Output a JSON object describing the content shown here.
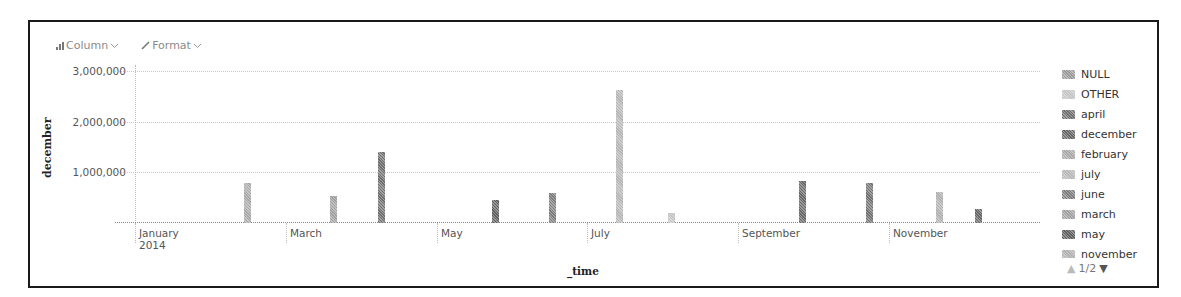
{
  "toolbar": {
    "chart_type_label": "Column",
    "chart_type_icon": "bar-chart-icon",
    "format_label": "Format",
    "format_icon": "pencil-icon"
  },
  "axes": {
    "y_title": "december",
    "x_title": "_time",
    "y_ticks": [
      {
        "label": "3,000,000",
        "value": 3000000
      },
      {
        "label": "2,000,000",
        "value": 2000000
      },
      {
        "label": "1,000,000",
        "value": 1000000
      }
    ],
    "x_ticks": [
      {
        "label": "January",
        "sub": "2014"
      },
      {
        "label": "March",
        "sub": ""
      },
      {
        "label": "May",
        "sub": ""
      },
      {
        "label": "July",
        "sub": ""
      },
      {
        "label": "September",
        "sub": ""
      },
      {
        "label": "November",
        "sub": ""
      }
    ]
  },
  "legend": {
    "items": [
      {
        "label": "NULL",
        "color": "#9a9a9a"
      },
      {
        "label": "OTHER",
        "color": "#c4c4c4"
      },
      {
        "label": "april",
        "color": "#6e6e6e"
      },
      {
        "label": "december",
        "color": "#666666"
      },
      {
        "label": "february",
        "color": "#a8a8a8"
      },
      {
        "label": "july",
        "color": "#b6b6b6"
      },
      {
        "label": "june",
        "color": "#7c7c7c"
      },
      {
        "label": "march",
        "color": "#a0a0a0"
      },
      {
        "label": "may",
        "color": "#5e5e5e"
      },
      {
        "label": "november",
        "color": "#b0b0b0"
      }
    ],
    "page_indicator": "1/2",
    "prev_icon": "triangle-up-icon",
    "next_icon": "triangle-down-icon"
  },
  "chart_data": {
    "type": "bar",
    "title": "",
    "xlabel": "_time",
    "ylabel": "december",
    "ylim": [
      0,
      3000000
    ],
    "grid": true,
    "legend_position": "right",
    "x_tick_labels": [
      "January 2014",
      "March",
      "May",
      "July",
      "September",
      "November"
    ],
    "legend": [
      "NULL",
      "OTHER",
      "april",
      "december",
      "february",
      "july",
      "june",
      "march",
      "may",
      "november"
    ],
    "bars": [
      {
        "date": "2014-02-15",
        "value": 790000,
        "color": "#a8a8a8"
      },
      {
        "date": "2014-03-22",
        "value": 530000,
        "color": "#a0a0a0"
      },
      {
        "date": "2014-04-10",
        "value": 1400000,
        "color": "#6e6e6e"
      },
      {
        "date": "2014-05-26",
        "value": 450000,
        "color": "#5e5e5e"
      },
      {
        "date": "2014-06-18",
        "value": 600000,
        "color": "#7c7c7c"
      },
      {
        "date": "2014-07-15",
        "value": 2620000,
        "color": "#b6b6b6"
      },
      {
        "date": "2014-08-05",
        "value": 190000,
        "color": "#c4c4c4"
      },
      {
        "date": "2014-09-27",
        "value": 830000,
        "color": "#666666"
      },
      {
        "date": "2014-10-24",
        "value": 790000,
        "color": "#707070"
      },
      {
        "date": "2014-11-21",
        "value": 610000,
        "color": "#b0b0b0"
      },
      {
        "date": "2014-12-07",
        "value": 280000,
        "color": "#666666"
      }
    ]
  }
}
